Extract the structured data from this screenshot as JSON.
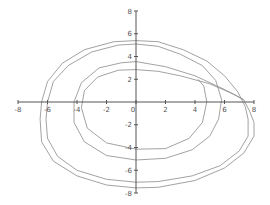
{
  "chart_data": {
    "type": "line",
    "title": "",
    "xlabel": "",
    "ylabel": "",
    "xlim": [
      -8,
      8
    ],
    "ylim": [
      -8,
      8
    ],
    "grid": false,
    "legend": null,
    "x_ticks": [
      -8,
      -6,
      -4,
      -2,
      0,
      2,
      4,
      6,
      8
    ],
    "y_ticks": [
      -8,
      -6,
      -4,
      -2,
      2,
      4,
      6,
      8
    ],
    "x_tick_labels": [
      "-8",
      "-6",
      "-4",
      "-2",
      "0",
      "2",
      "4",
      "6",
      "8"
    ],
    "y_tick_labels": [
      "-8",
      "-6",
      "-4",
      "-2",
      "2",
      "4",
      "6",
      "8"
    ],
    "colors": {
      "axis": "#555555",
      "curve": "#8a8a8a"
    },
    "series": [
      {
        "name": "trajectory-outer",
        "points": [
          [
            7.3,
            0.2
          ],
          [
            7.7,
            -0.8
          ],
          [
            8.0,
            -1.8
          ],
          [
            8.0,
            -3.0
          ],
          [
            7.3,
            -4.5
          ],
          [
            6.0,
            -5.8
          ],
          [
            4.0,
            -6.9
          ],
          [
            1.5,
            -7.5
          ],
          [
            0,
            -7.55
          ],
          [
            -2,
            -7.3
          ],
          [
            -4,
            -6.5
          ],
          [
            -5.6,
            -5.2
          ],
          [
            -6.4,
            -3.5
          ],
          [
            -6.5,
            -1.5
          ],
          [
            -6.4,
            0
          ],
          [
            -6.0,
            1.8
          ],
          [
            -5.0,
            3.4
          ],
          [
            -3.5,
            4.6
          ],
          [
            -1.5,
            5.3
          ],
          [
            0,
            5.4
          ],
          [
            1.5,
            5.3
          ],
          [
            3.2,
            4.6
          ],
          [
            4.8,
            3.6
          ],
          [
            6.0,
            2.3
          ],
          [
            6.9,
            0.9
          ],
          [
            7.4,
            -0.4
          ],
          [
            7.6,
            -1.5
          ],
          [
            7.6,
            -3.0
          ],
          [
            7.0,
            -4.3
          ],
          [
            5.7,
            -5.6
          ],
          [
            3.8,
            -6.5
          ],
          [
            1.5,
            -7.0
          ],
          [
            0,
            -7.05
          ],
          [
            -2,
            -6.8
          ],
          [
            -4,
            -6.0
          ],
          [
            -5.3,
            -4.8
          ],
          [
            -6.0,
            -3.2
          ],
          [
            -6.1,
            -1.5
          ],
          [
            -6.0,
            0
          ],
          [
            -5.6,
            1.8
          ],
          [
            -4.6,
            3.2
          ],
          [
            -3.0,
            4.4
          ],
          [
            -1.2,
            5.0
          ],
          [
            0,
            5.1
          ],
          [
            1.5,
            4.9
          ],
          [
            3.0,
            4.2
          ],
          [
            4.5,
            3.2
          ],
          [
            5.4,
            1.9
          ],
          [
            5.8,
            0.2
          ],
          [
            5.6,
            -1.5
          ],
          [
            5.0,
            -3.0
          ],
          [
            3.8,
            -4.2
          ],
          [
            2,
            -4.95
          ],
          [
            0,
            -5.1
          ],
          [
            -2,
            -4.7
          ],
          [
            -3.5,
            -3.5
          ],
          [
            -4.2,
            -1.8
          ],
          [
            -4.2,
            0
          ],
          [
            -3.7,
            1.7
          ],
          [
            -2.5,
            3.0
          ],
          [
            -1,
            3.45
          ],
          [
            0,
            3.55
          ],
          [
            2,
            3.1
          ],
          [
            4,
            2.3
          ],
          [
            6,
            1.1
          ],
          [
            7.3,
            0.2
          ]
        ]
      },
      {
        "name": "trajectory-inner",
        "points": [
          [
            7.3,
            0.2
          ],
          [
            6.6,
            0.7
          ],
          [
            5.0,
            1.6
          ],
          [
            3.0,
            2.3
          ],
          [
            1.5,
            2.7
          ],
          [
            0,
            2.85
          ],
          [
            -1.2,
            2.8
          ],
          [
            -2.6,
            2.2
          ],
          [
            -3.5,
            1.0
          ],
          [
            -3.7,
            -0.5
          ],
          [
            -3.3,
            -2.3
          ],
          [
            -2,
            -3.6
          ],
          [
            0,
            -4.15
          ],
          [
            2,
            -4.1
          ],
          [
            3.6,
            -3.2
          ],
          [
            4.5,
            -1.8
          ],
          [
            4.8,
            0
          ],
          [
            4.6,
            1.4
          ],
          [
            4.2,
            2.0
          ]
        ]
      }
    ]
  }
}
